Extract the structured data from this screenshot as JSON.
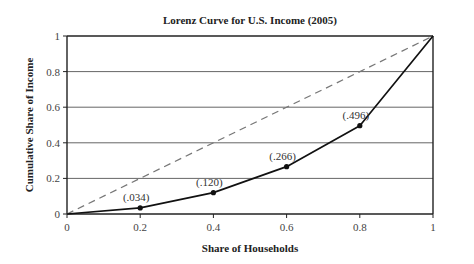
{
  "chart_data": {
    "type": "line",
    "title": "Lorenz Curve for U.S. Income (2005)",
    "xlabel": "Share of Households",
    "ylabel": "Cumulative Share of Income",
    "xlim": [
      0,
      1
    ],
    "ylim": [
      0,
      1
    ],
    "grid": "horizontal",
    "x_ticks": [
      "0",
      "0.2",
      "0.4",
      "0.6",
      "0.8",
      "1"
    ],
    "y_ticks": [
      "0",
      "0.2",
      "0.4",
      "0.6",
      "0.8",
      "1"
    ],
    "series": [
      {
        "name": "Lorenz Curve",
        "style": "solid",
        "color": "#111111",
        "x": [
          0,
          0.2,
          0.4,
          0.6,
          0.8,
          1
        ],
        "y": [
          0,
          0.034,
          0.12,
          0.266,
          0.496,
          1
        ],
        "labels": [
          "",
          "(.034)",
          "(.120)",
          "(.266)",
          "(.496)",
          ""
        ]
      },
      {
        "name": "Line of Equality",
        "style": "dashed",
        "color": "#777777",
        "x": [
          0,
          1
        ],
        "y": [
          0,
          1
        ]
      }
    ]
  }
}
